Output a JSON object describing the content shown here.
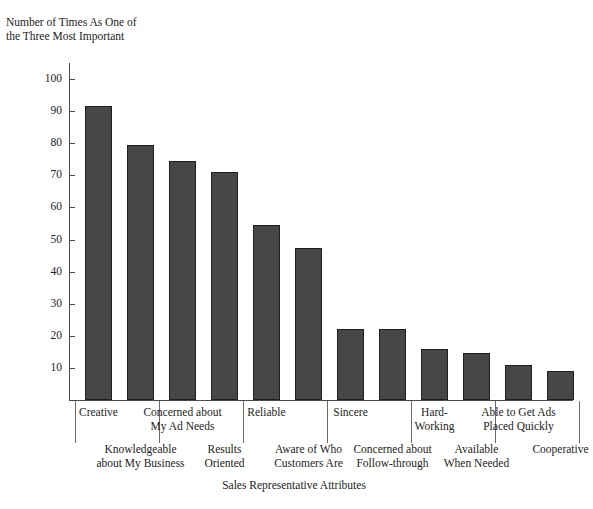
{
  "chart_data": {
    "type": "bar",
    "title": "",
    "ylabel": "Number of Times As One of\nthe Three Most Important",
    "xlabel": "Sales Representative Attributes",
    "ylim": [
      0,
      105
    ],
    "yticks": [
      10,
      20,
      30,
      40,
      50,
      60,
      70,
      80,
      90,
      100
    ],
    "grid": false,
    "legend": null,
    "categories": [
      "Creative",
      "Knowledgeable\nabout My Business",
      "Concerned about\nMy Ad Needs",
      "Results\nOriented",
      "Reliable",
      "Aware of Who\nCustomers Are",
      "Sincere",
      "Concerned about\nFollow-through",
      "Hard-\nWorking",
      "Available\nWhen Needed",
      "Able to Get Ads\nPlaced Quickly",
      "Cooperative"
    ],
    "values": [
      91.5,
      79.5,
      74.5,
      71,
      54.5,
      47.5,
      22,
      22,
      16,
      14.5,
      11,
      9
    ],
    "bar_color": "#474747",
    "bar_edge_color": "#1f1f1f",
    "axis_color": "#4a4a4a"
  }
}
